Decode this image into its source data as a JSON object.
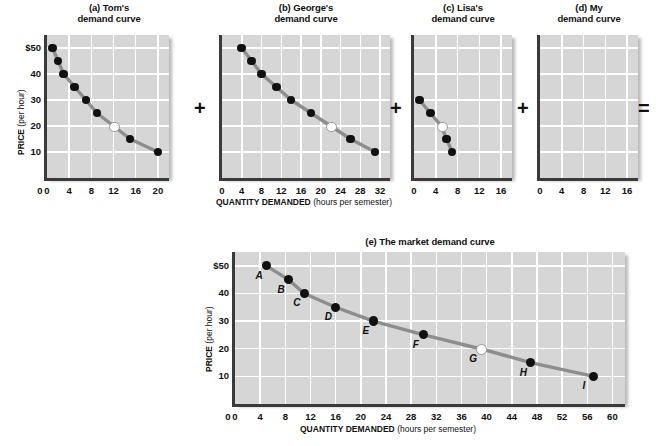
{
  "figure": {
    "axis_labels": {
      "y_main": "PRICE",
      "y_sub": " (per hour)",
      "x_main": "QUANTITY DEMANDED",
      "x_sub": " (hours per semester)"
    },
    "operators": {
      "plus": "+",
      "equals": "="
    }
  },
  "chart_data": [
    {
      "type": "scatter",
      "id": "tom",
      "title_line1": "(a) Tom's",
      "title_line2": "demand curve",
      "panel_letter": "a",
      "person": "Tom's",
      "xlabel": "QUANTITY DEMANDED (hours per semester)",
      "ylabel": "PRICE (per hour)",
      "xlim": [
        0,
        22
      ],
      "ylim": [
        0,
        55
      ],
      "xticks": [
        0,
        4,
        8,
        12,
        16,
        20
      ],
      "yticks": [
        "$50",
        "40",
        "30",
        "20",
        "10"
      ],
      "ytickvalues": [
        50,
        40,
        30,
        20,
        10
      ],
      "x": [
        1,
        2,
        3,
        5,
        7,
        9,
        12,
        15,
        20
      ],
      "y": [
        50,
        45,
        40,
        35,
        30,
        25,
        20,
        15,
        10
      ],
      "highlighted_index": 6,
      "grid": true,
      "legend": "none"
    },
    {
      "type": "scatter",
      "id": "george",
      "title_line1": "(b) George's",
      "title_line2": "demand curve",
      "panel_letter": "b",
      "person": "George's",
      "xlabel": "QUANTITY DEMANDED (hours per semester)",
      "ylabel": "PRICE (per hour)",
      "xlim": [
        0,
        34
      ],
      "ylim": [
        0,
        55
      ],
      "xticks": [
        0,
        4,
        8,
        12,
        16,
        20,
        24,
        28,
        32
      ],
      "yticks": [
        "$50",
        "40",
        "30",
        "20",
        "10"
      ],
      "ytickvalues": [
        50,
        40,
        30,
        20,
        10
      ],
      "x": [
        4,
        6,
        8,
        11,
        14,
        18,
        22,
        26,
        31
      ],
      "y": [
        50,
        45,
        40,
        35,
        30,
        25,
        20,
        15,
        10
      ],
      "highlighted_index": 6,
      "grid": true,
      "legend": "none"
    },
    {
      "type": "scatter",
      "id": "lisa",
      "title_line1": "(c) Lisa's",
      "title_line2": "demand curve",
      "panel_letter": "c",
      "person": "Lisa's",
      "xlabel": "QUANTITY DEMANDED (hours per semester)",
      "ylabel": "PRICE (per hour)",
      "xlim": [
        0,
        18
      ],
      "ylim": [
        0,
        55
      ],
      "xticks": [
        0,
        4,
        8,
        12,
        16
      ],
      "yticks": [
        "$50",
        "40",
        "30",
        "20",
        "10"
      ],
      "ytickvalues": [
        50,
        40,
        30,
        20,
        10
      ],
      "x": [
        1,
        3,
        5,
        6,
        7
      ],
      "y": [
        30,
        25,
        20,
        15,
        10
      ],
      "highlighted_index": 2,
      "grid": true,
      "legend": "none"
    },
    {
      "type": "scatter",
      "id": "my",
      "title_line1": "(d) My",
      "title_line2": "demand curve",
      "panel_letter": "d",
      "person": "My",
      "xlabel": "QUANTITY DEMANDED (hours per semester)",
      "ylabel": "PRICE (per hour)",
      "xlim": [
        0,
        18
      ],
      "ylim": [
        0,
        55
      ],
      "xticks": [
        0,
        4,
        8,
        12,
        16
      ],
      "yticks": [
        "$50",
        "40",
        "30",
        "20",
        "10"
      ],
      "ytickvalues": [
        50,
        40,
        30,
        20,
        10
      ],
      "x": [],
      "y": [],
      "highlighted_index": -1,
      "grid": true,
      "legend": "none"
    },
    {
      "type": "scatter",
      "id": "market",
      "title": "(e) The market demand curve",
      "title_line1": "(e) The market demand curve",
      "panel_letter": "e",
      "xlabel": "QUANTITY DEMANDED (hours per semester)",
      "ylabel": "PRICE (per hour)",
      "xlim": [
        0,
        62
      ],
      "ylim": [
        0,
        55
      ],
      "xticks": [
        0,
        4,
        8,
        12,
        16,
        20,
        24,
        28,
        32,
        36,
        40,
        44,
        48,
        52,
        56,
        60
      ],
      "yticks": [
        "$50",
        "40",
        "30",
        "20",
        "10"
      ],
      "ytickvalues": [
        50,
        40,
        30,
        20,
        10
      ],
      "x": [
        5,
        8.5,
        11,
        16,
        22,
        30,
        39,
        47,
        57
      ],
      "y": [
        50,
        45,
        40,
        35,
        30,
        25,
        20,
        15,
        10
      ],
      "point_labels": [
        "A",
        "B",
        "C",
        "D",
        "E",
        "F",
        "G",
        "H",
        "I"
      ],
      "highlighted_index": 6,
      "grid": true,
      "legend": "none"
    }
  ]
}
